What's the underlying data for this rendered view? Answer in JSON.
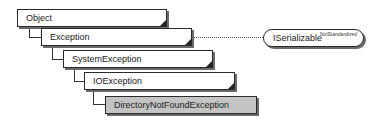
{
  "diagram": {
    "type": "class-hierarchy",
    "classes": [
      {
        "name": "Object",
        "level": 0,
        "selected": false
      },
      {
        "name": "Exception",
        "level": 1,
        "selected": false
      },
      {
        "name": "SystemException",
        "level": 2,
        "selected": false
      },
      {
        "name": "IOException",
        "level": 3,
        "selected": false
      },
      {
        "name": "DirectoryNotFoundException",
        "level": 4,
        "selected": true
      }
    ],
    "interface": {
      "name": "ISerializable",
      "tag": "NotStandardized",
      "implemented_by": "Exception"
    },
    "colors": {
      "selected_fill": "#c4c4c4",
      "box_fill": "#ffffff",
      "border": "#2a2a2a"
    }
  }
}
